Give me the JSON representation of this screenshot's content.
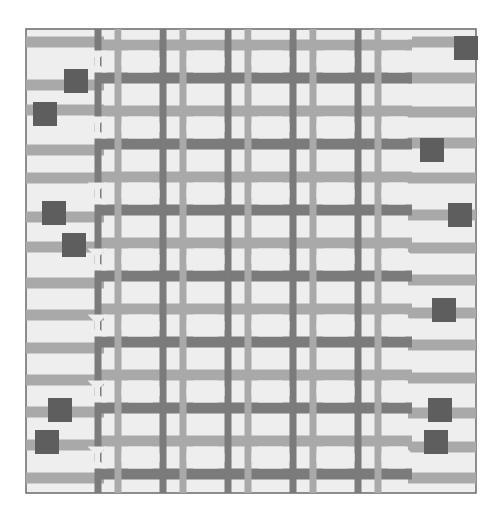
{
  "image": {
    "subject": "Quilt with interlocking octagon lattice and horizontal stripes",
    "colors": {
      "background": "#ffffff",
      "quilt_field": "#eeeeee",
      "light_band": "#a9a9a9",
      "dark_band": "#7b7b7b",
      "square_block": "#5e5e5e",
      "border_line": "#6a6a6a"
    }
  },
  "quilt": {
    "x": 26,
    "y": 29,
    "width": 450,
    "height": 464,
    "lattice": {
      "x0": 100,
      "x1": 412,
      "col_lines": [
        108,
        173,
        238,
        303,
        368
      ],
      "row_lines": [
        45,
        78,
        111,
        144,
        177,
        210,
        243,
        276,
        309,
        342,
        375,
        408,
        441,
        474
      ],
      "band_width": 11
    },
    "left_stripes_y": [
      42,
      85,
      110,
      150,
      178,
      217,
      247,
      283,
      315,
      348,
      380,
      412,
      445,
      478
    ],
    "right_stripes_y": [
      42,
      78,
      112,
      143,
      178,
      215,
      248,
      280,
      313,
      345,
      378,
      413,
      447,
      478
    ],
    "squares": [
      {
        "x": 64,
        "y": 69,
        "s": 24
      },
      {
        "x": 33,
        "y": 102,
        "s": 24
      },
      {
        "x": 42,
        "y": 201,
        "s": 24
      },
      {
        "x": 62,
        "y": 233,
        "s": 24
      },
      {
        "x": 454,
        "y": 36,
        "s": 24
      },
      {
        "x": 420,
        "y": 138,
        "s": 24
      },
      {
        "x": 448,
        "y": 203,
        "s": 24
      },
      {
        "x": 432,
        "y": 298,
        "s": 24
      },
      {
        "x": 48,
        "y": 398,
        "s": 24
      },
      {
        "x": 35,
        "y": 430,
        "s": 24
      },
      {
        "x": 428,
        "y": 398,
        "s": 24
      },
      {
        "x": 424,
        "y": 430,
        "s": 24
      }
    ]
  }
}
